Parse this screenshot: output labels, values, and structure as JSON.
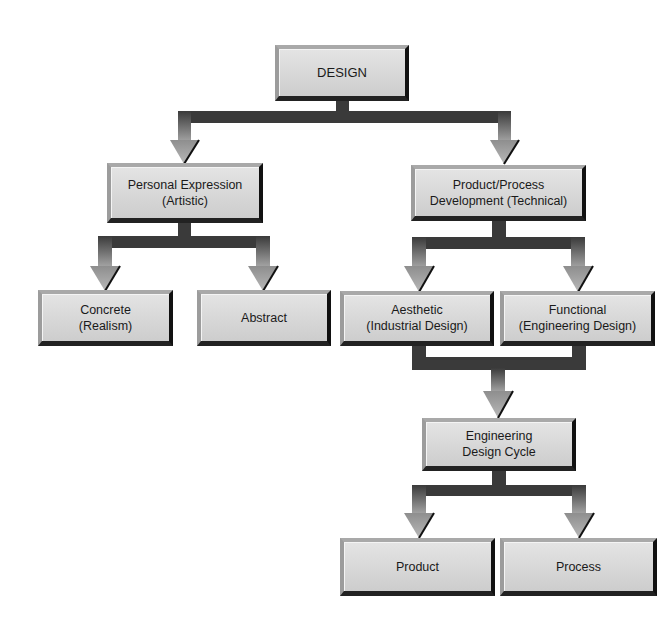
{
  "diagram": {
    "title": "DESIGN",
    "nodes": {
      "design": {
        "lines": [
          "DESIGN"
        ]
      },
      "personal_expression": {
        "lines": [
          "Personal Expression",
          "(Artistic)"
        ]
      },
      "product_process": {
        "lines": [
          "Product/Process",
          "Development (Technical)"
        ]
      },
      "concrete": {
        "lines": [
          "Concrete",
          "(Realism)"
        ]
      },
      "abstract": {
        "lines": [
          "Abstract"
        ]
      },
      "aesthetic": {
        "lines": [
          "Aesthetic",
          "(Industrial Design)"
        ]
      },
      "functional": {
        "lines": [
          "Functional",
          "(Engineering Design)"
        ]
      },
      "engineering_design_cycle": {
        "lines": [
          "Engineering",
          "Design Cycle"
        ]
      },
      "product": {
        "lines": [
          "Product"
        ]
      },
      "process": {
        "lines": [
          "Process"
        ]
      }
    },
    "edges": [
      {
        "from": "DESIGN",
        "to": "Personal Expression (Artistic)"
      },
      {
        "from": "DESIGN",
        "to": "Product/Process Development (Technical)"
      },
      {
        "from": "Personal Expression (Artistic)",
        "to": "Concrete (Realism)"
      },
      {
        "from": "Personal Expression (Artistic)",
        "to": "Abstract"
      },
      {
        "from": "Product/Process Development (Technical)",
        "to": "Aesthetic (Industrial Design)"
      },
      {
        "from": "Product/Process Development (Technical)",
        "to": "Functional (Engineering Design)"
      },
      {
        "from": "Aesthetic (Industrial Design)",
        "to": "Engineering Design Cycle"
      },
      {
        "from": "Functional (Engineering Design)",
        "to": "Engineering Design Cycle"
      },
      {
        "from": "Engineering Design Cycle",
        "to": "Product"
      },
      {
        "from": "Engineering Design Cycle",
        "to": "Process"
      }
    ],
    "colors": {
      "box_fill": "#d8d8d8",
      "connector": "#3a3a3a",
      "arrow_light": "#9a9a9a",
      "text": "#1a1a1a",
      "background": "#ffffff"
    }
  }
}
